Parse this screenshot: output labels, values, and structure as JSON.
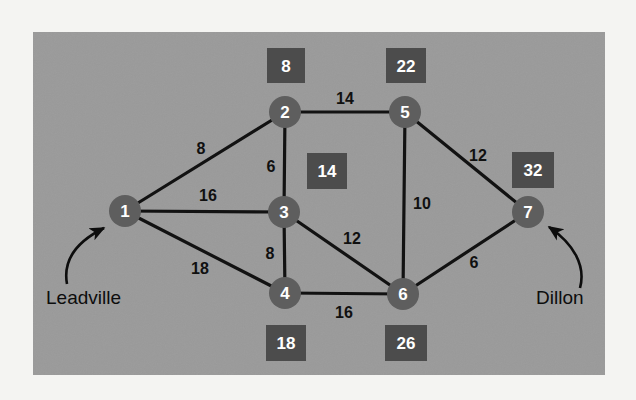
{
  "figure": {
    "type": "weighted-network-graph",
    "canvas": {
      "width": 636,
      "height": 400,
      "page_background": "#f4f4f2"
    },
    "panel": {
      "x": 33,
      "y": 32,
      "width": 572,
      "height": 343,
      "fill": "#9a9a9a"
    },
    "colors": {
      "panel_gray": "#9a9a9a",
      "node_fill": "#5e5e5e",
      "box_fill": "#4c4c4c",
      "edge_stroke": "#121212",
      "label_text": "#ffffff",
      "weight_text": "#101010",
      "place_text": "#0d0d0d"
    },
    "nodes": [
      {
        "id": "1",
        "label": "1",
        "cx": 125,
        "cy": 211,
        "r": 16
      },
      {
        "id": "2",
        "label": "2",
        "cx": 285,
        "cy": 112,
        "r": 16
      },
      {
        "id": "3",
        "label": "3",
        "cx": 284,
        "cy": 212,
        "r": 16
      },
      {
        "id": "4",
        "label": "4",
        "cx": 285,
        "cy": 293,
        "r": 16
      },
      {
        "id": "5",
        "label": "5",
        "cx": 405,
        "cy": 112,
        "r": 16
      },
      {
        "id": "6",
        "label": "6",
        "cx": 403,
        "cy": 294,
        "r": 16
      },
      {
        "id": "7",
        "label": "7",
        "cx": 528,
        "cy": 212,
        "r": 16
      }
    ],
    "edges": [
      {
        "from": "1",
        "to": "2",
        "weight": "8",
        "label_x": 201,
        "label_y": 148
      },
      {
        "from": "1",
        "to": "3",
        "weight": "16",
        "label_x": 208,
        "label_y": 195
      },
      {
        "from": "1",
        "to": "4",
        "weight": "18",
        "label_x": 200,
        "label_y": 268
      },
      {
        "from": "2",
        "to": "3",
        "weight": "6",
        "label_x": 271,
        "label_y": 166
      },
      {
        "from": "2",
        "to": "5",
        "weight": "14",
        "label_x": 345,
        "label_y": 98
      },
      {
        "from": "3",
        "to": "4",
        "weight": "8",
        "label_x": 270,
        "label_y": 253
      },
      {
        "from": "3",
        "to": "6",
        "weight": "12",
        "label_x": 352,
        "label_y": 238
      },
      {
        "from": "4",
        "to": "6",
        "weight": "16",
        "label_x": 344,
        "label_y": 312
      },
      {
        "from": "5",
        "to": "6",
        "weight": "10",
        "label_x": 422,
        "label_y": 203
      },
      {
        "from": "5",
        "to": "7",
        "weight": "12",
        "label_x": 478,
        "label_y": 155
      },
      {
        "from": "6",
        "to": "7",
        "weight": "6",
        "label_x": 474,
        "label_y": 262
      }
    ],
    "value_boxes": [
      {
        "node": "2",
        "value": "8",
        "x": 267,
        "y": 48,
        "w": 38,
        "h": 35
      },
      {
        "node": "5",
        "value": "22",
        "x": 386,
        "y": 48,
        "w": 40,
        "h": 35
      },
      {
        "node": "3",
        "value": "14",
        "x": 307,
        "y": 153,
        "w": 40,
        "h": 36
      },
      {
        "node": "7",
        "value": "32",
        "x": 512,
        "y": 152,
        "w": 42,
        "h": 36
      },
      {
        "node": "4",
        "value": "18",
        "x": 266,
        "y": 325,
        "w": 40,
        "h": 36
      },
      {
        "node": "6",
        "value": "26",
        "x": 385,
        "y": 325,
        "w": 42,
        "h": 36
      }
    ],
    "annotations": [
      {
        "id": "leadville",
        "text": "Leadville",
        "x": 46,
        "y": 295,
        "target_node": "1"
      },
      {
        "id": "dillon",
        "text": "Dillon",
        "x": 536,
        "y": 296,
        "target_node": "7"
      }
    ]
  }
}
